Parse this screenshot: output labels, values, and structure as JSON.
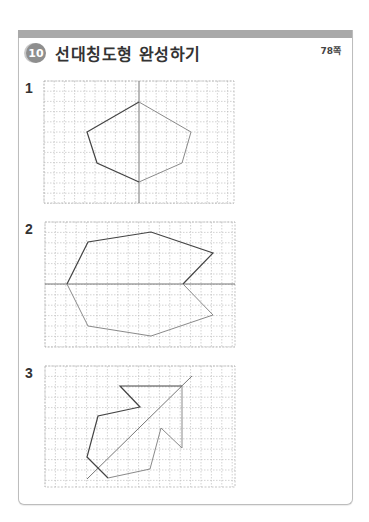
{
  "header": {
    "badge": "10",
    "title": "선대칭도형 완성하기",
    "page_ref": "78쪽"
  },
  "problems": [
    {
      "label": "1",
      "grid": {
        "x": 44,
        "y": 81,
        "w": 190,
        "h": 122,
        "cell": 10.2
      },
      "axis": [
        [
          139,
          81
        ],
        [
          139,
          203
        ]
      ],
      "given": [
        [
          139,
          102
        ],
        [
          87,
          132
        ],
        [
          97,
          163
        ],
        [
          139,
          182
        ]
      ],
      "completed": [
        [
          139,
          102
        ],
        [
          191,
          132
        ],
        [
          182,
          163
        ],
        [
          139,
          182
        ]
      ]
    },
    {
      "label": "2",
      "grid": {
        "x": 45,
        "y": 222,
        "w": 190,
        "h": 125,
        "cell": 10.4
      },
      "axis": [
        [
          45,
          284
        ],
        [
          235,
          284
        ]
      ],
      "given": [
        [
          67,
          284
        ],
        [
          88,
          242
        ],
        [
          151,
          232
        ],
        [
          213,
          253
        ],
        [
          183,
          284
        ]
      ],
      "completed": [
        [
          67,
          284
        ],
        [
          88,
          326
        ],
        [
          151,
          336
        ],
        [
          213,
          315
        ],
        [
          183,
          284
        ]
      ]
    },
    {
      "label": "3",
      "grid": {
        "x": 45,
        "y": 366,
        "w": 190,
        "h": 121,
        "cell": 10.4
      },
      "axis": [
        [
          87,
          479
        ],
        [
          192,
          376
        ]
      ],
      "given": [
        [
          182,
          386
        ],
        [
          120,
          386
        ],
        [
          140,
          407
        ],
        [
          98,
          416
        ],
        [
          87,
          457
        ],
        [
          108,
          478
        ]
      ],
      "completed": [
        [
          182,
          386
        ],
        [
          182,
          448
        ],
        [
          161,
          428
        ],
        [
          150,
          469
        ],
        [
          108,
          478
        ]
      ]
    }
  ],
  "colors": {
    "band": "#a9a9a9",
    "grid_line": "#b5b5b5",
    "given_line": "#444444",
    "completed_line": "#8a8a8a",
    "axis_line": "#777777"
  }
}
